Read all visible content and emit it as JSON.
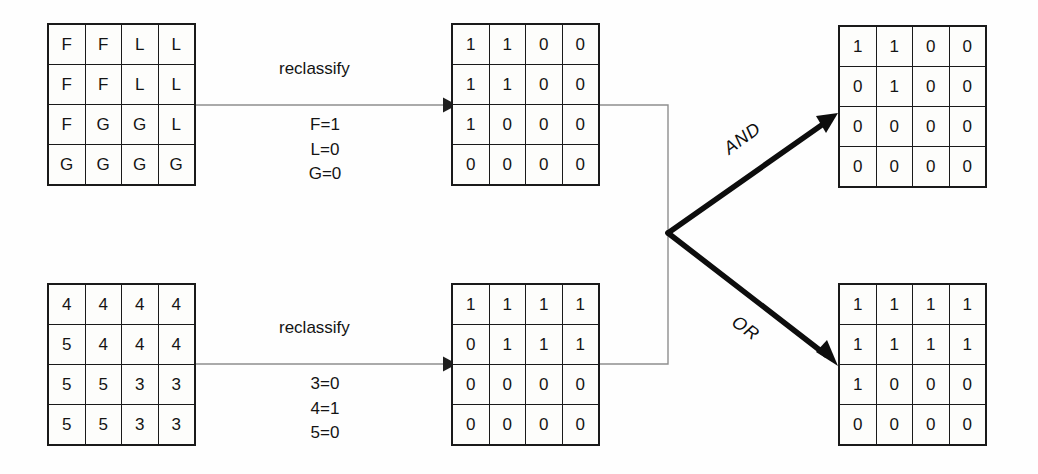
{
  "diagram": {
    "colors": {
      "grid_border": "#1a1a1a",
      "cell_fill": "#fdfdfb",
      "thin_connector": "#8e8e8e",
      "thick_arrow": "#0d0d0d",
      "text": "#141414"
    }
  },
  "grids": {
    "input_top": {
      "name": "Forest/Land/Grass classes",
      "rows": [
        [
          "F",
          "F",
          "L",
          "L"
        ],
        [
          "F",
          "F",
          "L",
          "L"
        ],
        [
          "F",
          "G",
          "G",
          "L"
        ],
        [
          "G",
          "G",
          "G",
          "G"
        ]
      ]
    },
    "reclass_top": {
      "name": "Top reclassified binary raster",
      "rows": [
        [
          "1",
          "1",
          "0",
          "0"
        ],
        [
          "1",
          "1",
          "0",
          "0"
        ],
        [
          "1",
          "0",
          "0",
          "0"
        ],
        [
          "0",
          "0",
          "0",
          "0"
        ]
      ]
    },
    "input_bottom": {
      "name": "Numeric soil classes",
      "rows": [
        [
          "4",
          "4",
          "4",
          "4"
        ],
        [
          "5",
          "4",
          "4",
          "4"
        ],
        [
          "5",
          "5",
          "3",
          "3"
        ],
        [
          "5",
          "5",
          "3",
          "3"
        ]
      ]
    },
    "reclass_bottom": {
      "name": "Bottom reclassified binary raster",
      "rows": [
        [
          "1",
          "1",
          "1",
          "1"
        ],
        [
          "0",
          "1",
          "1",
          "1"
        ],
        [
          "0",
          "0",
          "0",
          "0"
        ],
        [
          "0",
          "0",
          "0",
          "0"
        ]
      ]
    },
    "result_and": {
      "name": "AND overlay result",
      "rows": [
        [
          "1",
          "1",
          "0",
          "0"
        ],
        [
          "0",
          "1",
          "0",
          "0"
        ],
        [
          "0",
          "0",
          "0",
          "0"
        ],
        [
          "0",
          "0",
          "0",
          "0"
        ]
      ]
    },
    "result_or": {
      "name": "OR overlay result",
      "rows": [
        [
          "1",
          "1",
          "1",
          "1"
        ],
        [
          "1",
          "1",
          "1",
          "1"
        ],
        [
          "1",
          "0",
          "0",
          "0"
        ],
        [
          "0",
          "0",
          "0",
          "0"
        ]
      ]
    }
  },
  "labels": {
    "reclassify_top": "reclassify",
    "reclassify_bottom": "reclassify",
    "rules_top": [
      "F=1",
      "L=0",
      "G=0"
    ],
    "rules_bottom": [
      "3=0",
      "4=1",
      "5=0"
    ],
    "operator_and": "AND",
    "operator_or": "OR"
  }
}
